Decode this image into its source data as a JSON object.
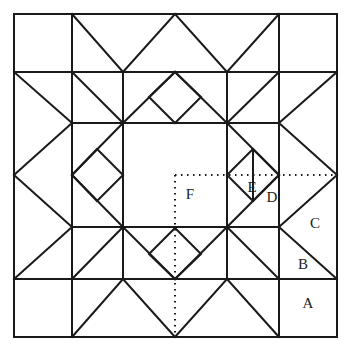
{
  "diagram": {
    "type": "geometric-quilt-block",
    "stroke_color": "#1a1a1a",
    "background_color": "#ffffff",
    "labels": [
      {
        "id": "A",
        "text": "A",
        "x": 308,
        "y": 305,
        "region": "bottom-right-corner-square"
      },
      {
        "id": "B",
        "text": "B",
        "x": 303,
        "y": 266,
        "region": "lower-right-edge-triangle"
      },
      {
        "id": "C",
        "text": "C",
        "x": 315,
        "y": 225,
        "region": "upper-right-edge-triangle"
      },
      {
        "id": "D",
        "text": "D",
        "x": 272,
        "y": 199,
        "region": "right-diamond-lower-right-triangle"
      },
      {
        "id": "E",
        "text": "E",
        "x": 252,
        "y": 189,
        "region": "right-diamond-lower-left-triangle"
      },
      {
        "id": "F",
        "text": "F",
        "x": 190,
        "y": 196,
        "region": "center-square"
      }
    ],
    "geometry": {
      "outer": {
        "x0": 14,
        "y0": 14,
        "x1": 337,
        "y1": 337
      },
      "grid_lines": [
        72,
        123,
        175,
        227,
        279
      ],
      "unit": 52,
      "border_band": 58
    },
    "solid_paths": [
      "M14 14 L337 14 L337 337 L14 337 Z",
      "M72 14 L72 337",
      "M279 14 L279 337",
      "M14 72 L337 72",
      "M14 279 L337 279",
      "M72 123 L279 123",
      "M72 227 L279 227",
      "M123 72 L123 279",
      "M227 72 L227 279",
      "M72 14 L123 72",
      "M123 72 L175 14",
      "M175 14 L227 72",
      "M227 72 L279 14",
      "M72 337 L123 279",
      "M123 279 L175 337",
      "M175 337 L227 279",
      "M227 279 L279 337",
      "M14 72 L72 123",
      "M72 123 L14 175",
      "M14 175 L72 227",
      "M72 227 L14 279",
      "M337 72 L279 123",
      "M279 123 L337 175",
      "M337 175 L279 227",
      "M279 227 L337 279",
      "M149 97 L175 72 L201 97 L175 123 Z",
      "M149 253 L175 227 L201 253 L175 279 Z",
      "M97 149 L123 123 L149 149 L123 175 Z",
      "M253 149 L279 123 L253 201 L227 175 Z",
      "M227 175 L279 175",
      "M253 201 L253 149",
      "M97 201 L123 227 L149 201 L123 175 Z",
      "M72 123 L123 72",
      "M72 227 L123 279",
      "M227 72 L279 123",
      "M227 279 L279 227",
      "M123 123 L72 72",
      "M227 123 L279 72",
      "M123 227 L72 279",
      "M227 227 L279 279"
    ],
    "dotted_paths": [
      "M175 175 L337 175",
      "M175 175 L175 337"
    ]
  }
}
